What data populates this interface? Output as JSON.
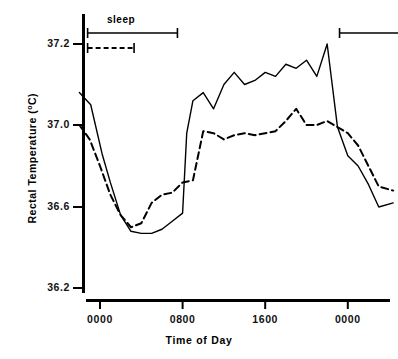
{
  "chart_data": {
    "type": "line",
    "title": "",
    "xlabel": "Time of Day",
    "ylabel": "Rectal Temperature (°C)",
    "ylabel_text": "Rectal Temperature (",
    "ylabel_unit": "o",
    "ylabel_suffix": "C)",
    "grid": false,
    "legend": "none",
    "x_tick_labels": [
      "0000",
      "0800",
      "1600",
      "0000"
    ],
    "x_tick_hours": [
      0,
      8,
      16,
      24
    ],
    "y_tick_labels": [
      "37.2",
      "37.0",
      "36.6",
      "36.2"
    ],
    "y_tick_values": [
      37.2,
      37.0,
      36.6,
      36.2
    ],
    "ylim": [
      36.2,
      37.2
    ],
    "xlim": [
      -2,
      29
    ],
    "axis_note": "non-linear y spacing: 37.0-37.2 occupies same pixel span as 36.6-37.0 and 36.2-36.6",
    "series": [
      {
        "name": "solid",
        "style": "solid",
        "color": "#000000",
        "x": [
          -2.0,
          -0.9,
          0.2,
          1.0,
          2.0,
          3.0,
          4.0,
          5.0,
          6.0,
          7.0,
          8.0,
          8.4,
          9.0,
          10.0,
          11.0,
          12.0,
          13.0,
          14.0,
          15.0,
          16.0,
          17.0,
          18.0,
          19.0,
          20.0,
          21.0,
          22.0,
          23.0,
          24.0,
          25.0,
          26.0,
          27.0,
          28.4
        ],
        "y": [
          37.08,
          37.05,
          36.86,
          36.72,
          36.56,
          36.48,
          36.47,
          36.47,
          36.49,
          36.53,
          36.57,
          36.96,
          37.06,
          37.08,
          37.04,
          37.1,
          37.13,
          37.1,
          37.11,
          37.13,
          37.12,
          37.15,
          37.14,
          37.16,
          37.12,
          37.2,
          36.99,
          36.85,
          36.8,
          36.71,
          36.6,
          36.62
        ]
      },
      {
        "name": "dashed",
        "style": "dashed",
        "color": "#000000",
        "x": [
          -2.0,
          -1.0,
          0.0,
          1.0,
          2.0,
          3.0,
          4.0,
          5.0,
          6.0,
          7.0,
          8.0,
          9.0,
          10.0,
          11.0,
          12.0,
          13.0,
          14.0,
          15.0,
          16.0,
          17.0,
          18.0,
          19.0,
          20.0,
          21.0,
          22.0,
          23.0,
          24.0,
          25.0,
          26.0,
          27.0,
          28.4
        ],
        "y": [
          37.0,
          36.93,
          36.8,
          36.66,
          36.56,
          36.5,
          36.52,
          36.62,
          36.66,
          36.67,
          36.72,
          36.73,
          36.97,
          36.96,
          36.93,
          36.95,
          36.96,
          36.95,
          36.96,
          36.97,
          37.01,
          37.04,
          37.0,
          37.0,
          37.01,
          36.99,
          36.96,
          36.9,
          36.8,
          36.7,
          36.68
        ]
      }
    ],
    "annotations": {
      "sleep_label": "sleep",
      "sleep_bars": [
        {
          "name": "sleep-bar-solid-night1",
          "style": "solid",
          "x_start": -1.2,
          "x_end": 7.5,
          "row": 0
        },
        {
          "name": "sleep-bar-dashed-night1",
          "style": "dashed",
          "x_start": -1.2,
          "x_end": 3.3,
          "row": 1
        },
        {
          "name": "sleep-bar-solid-night2",
          "style": "solid",
          "x_start": 23.2,
          "x_end": 29.0,
          "row": 0
        }
      ]
    }
  }
}
